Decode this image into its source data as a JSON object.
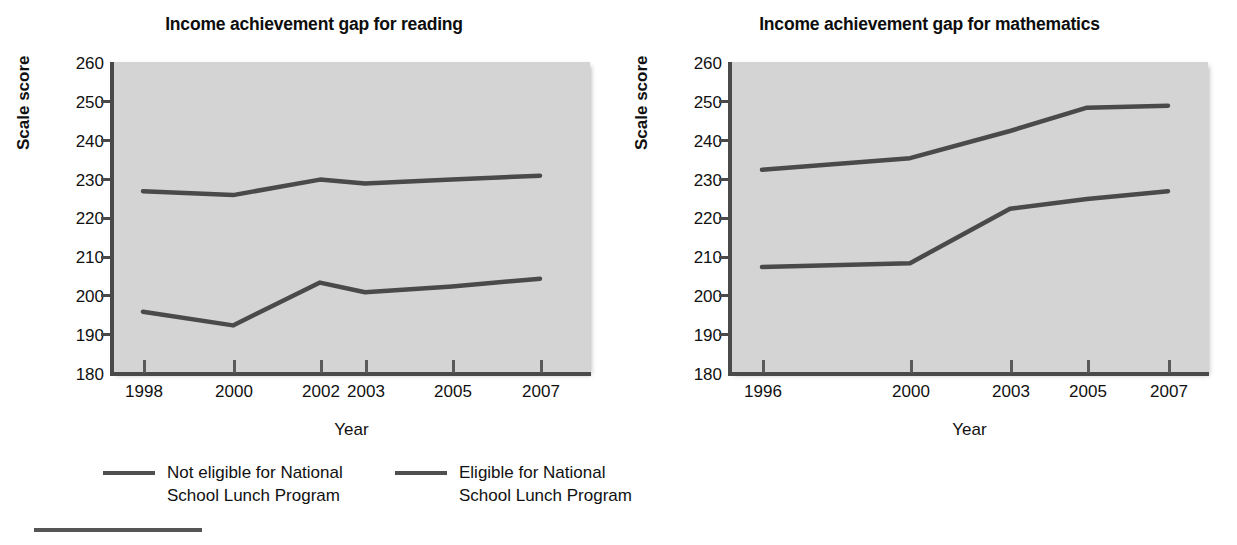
{
  "chart_data": [
    {
      "type": "line",
      "title": "Income achievement gap for reading",
      "xlabel": "Year",
      "ylabel": "Scale score",
      "ylim": [
        180,
        260
      ],
      "ytick_labels": [
        "260",
        "250",
        "240",
        "230",
        "220",
        "210",
        "200",
        "190",
        "180"
      ],
      "yticks": [
        260,
        250,
        240,
        230,
        220,
        210,
        200,
        190,
        180
      ],
      "xtick_labels": [
        "1998",
        "2000",
        "2002",
        "2003",
        "2005",
        "2007"
      ],
      "x": [
        1998,
        2000,
        2002,
        2003,
        2005,
        2007
      ],
      "grid": false,
      "legend_position": "below-figure",
      "series": [
        {
          "name": "Not eligible for National School Lunch Program",
          "values": [
            226.5,
            225.5,
            229.5,
            228.5,
            229.5,
            230.5
          ]
        },
        {
          "name": "Eligible for National School Lunch Program",
          "values": [
            195.5,
            192,
            203,
            200.5,
            202,
            204
          ]
        }
      ]
    },
    {
      "type": "line",
      "title": "Income achievement gap for mathematics",
      "xlabel": "Year",
      "ylabel": "Scale score",
      "ylim": [
        180,
        260
      ],
      "ytick_labels": [
        "260",
        "250",
        "240",
        "230",
        "220",
        "210",
        "200",
        "190",
        "180"
      ],
      "yticks": [
        260,
        250,
        240,
        230,
        220,
        210,
        200,
        190,
        180
      ],
      "xtick_labels": [
        "1996",
        "2000",
        "2003",
        "2005",
        "2007"
      ],
      "x": [
        1996,
        2000,
        2003,
        2005,
        2007
      ],
      "grid": false,
      "legend_position": "below-figure",
      "series": [
        {
          "name": "Not eligible for National School Lunch Program",
          "values": [
            232,
            235,
            242,
            248,
            248.5
          ]
        },
        {
          "name": "Eligible for National School Lunch Program",
          "values": [
            207,
            208,
            222,
            224.5,
            226.5
          ]
        }
      ]
    }
  ],
  "panels": {
    "reading": {
      "title": "Income achievement gap for reading",
      "xlabel": "Year",
      "ylabel": "Scale score"
    },
    "mathematics": {
      "title": "Income achievement gap for mathematics",
      "xlabel": "Year",
      "ylabel": "Scale score"
    }
  },
  "legend": {
    "entries": [
      {
        "label": "Not eligible for National\nSchool Lunch Program"
      },
      {
        "label": "Eligible for National\nSchool Lunch Program"
      }
    ]
  },
  "colors": {
    "plot_background": "#d4d4d4",
    "line": "#4a4a4a",
    "axis": "#4a4a4a",
    "text": "#111111",
    "page_background": "#ffffff"
  }
}
